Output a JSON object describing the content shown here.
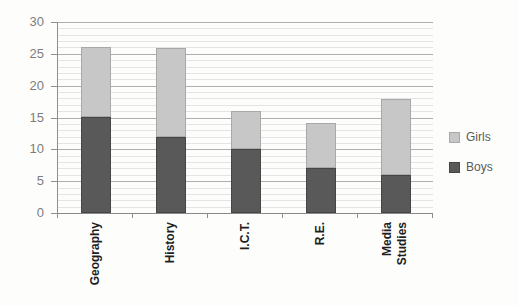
{
  "chart_data": {
    "type": "bar",
    "stacked": true,
    "title": "",
    "xlabel": "",
    "ylabel": "",
    "categories": [
      "Geography",
      "History",
      "I.C.T.",
      "R.E.",
      "Media Studies"
    ],
    "series": [
      {
        "name": "Boys",
        "color": "#595959",
        "border": "#454545",
        "values": [
          15,
          12,
          10,
          7,
          6
        ]
      },
      {
        "name": "Girls",
        "color": "#c7c7c7",
        "border": "#a9a9a9",
        "values": [
          11,
          14,
          6,
          7,
          12
        ]
      }
    ],
    "totals": [
      26,
      26,
      16,
      14,
      18
    ],
    "ylim": [
      0,
      30
    ],
    "yticks": [
      0,
      5,
      10,
      15,
      20,
      25,
      30
    ],
    "ytick_step": 5,
    "minor_grid_step": 1,
    "grid": true,
    "legend_position": "right",
    "legend_order": [
      "Girls",
      "Boys"
    ]
  },
  "colors": {
    "axis": "#8f8f8f",
    "major_grid": "#aeaeae",
    "minor_grid": "#e4e4e4",
    "y_label_text": "#7d7d7d",
    "x_label_text": "#1e1e1e",
    "legend_text": "#5a5a5a",
    "background": "#fdfdfc"
  }
}
